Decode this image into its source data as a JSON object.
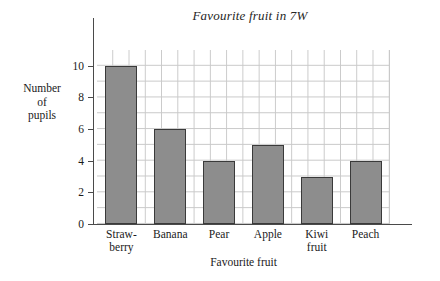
{
  "chart_data": {
    "type": "bar",
    "title": "Favourite fruit in 7W",
    "xlabel": "Favourite fruit",
    "ylabel": "Number\nof\npupils",
    "categories": [
      "Straw-\nberry",
      "Banana",
      "Pear",
      "Apple",
      "Kiwi\nfruit",
      "Peach"
    ],
    "values": [
      10,
      6,
      4,
      5,
      3,
      4
    ],
    "ylim": [
      0,
      11
    ],
    "y_ticks": [
      0,
      2,
      4,
      6,
      8,
      10
    ],
    "y_tick_labels": [
      "0",
      "2",
      "4",
      "6",
      "8",
      "10"
    ],
    "grid": true,
    "legend": "none",
    "bar_fill_color": "#8d8d8d",
    "bar_edge_color": "#3a3a3a",
    "grid_color": "#c9c9c9",
    "axis_color": "#4a4a4a"
  }
}
